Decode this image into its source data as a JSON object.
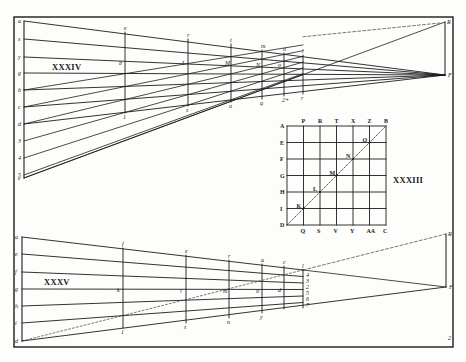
{
  "colors": {
    "ink": "#1c1c1c",
    "paper": "#fdfdfb",
    "faint": "#555555"
  },
  "frame": {
    "x": 14,
    "y": 17,
    "w": 439,
    "h": 330
  },
  "page_mark": {
    "text": "2",
    "x": 448,
    "y": 340
  },
  "figure_xxxiv": {
    "caption": "XXXIV",
    "caption_pos": [
      52,
      70
    ],
    "left_x": 24,
    "left_points": [
      {
        "label": "a",
        "y": 21
      },
      {
        "label": "s",
        "y": 39
      },
      {
        "label": "y",
        "y": 57
      },
      {
        "label": "g",
        "y": 73
      },
      {
        "label": "b",
        "y": 90
      },
      {
        "label": "c",
        "y": 107
      },
      {
        "label": "d",
        "y": 124
      },
      {
        "label": "3",
        "y": 141
      },
      {
        "label": "4",
        "y": 158
      },
      {
        "label": "5",
        "y": 175
      },
      {
        "label": "e",
        "y": 178
      }
    ],
    "vanish_low": {
      "label": "F",
      "x": 445,
      "y": 75
    },
    "vanish_high": {
      "label": "R",
      "x": 445,
      "y": 22
    },
    "verticals": [
      {
        "x": 125,
        "y1": 32,
        "y2": 113,
        "top": "e",
        "mid": "b",
        "bot": "1"
      },
      {
        "x": 188,
        "y1": 39,
        "y2": 106,
        "top": "r",
        "mid": "L",
        "bot": "s"
      },
      {
        "x": 231,
        "y1": 44,
        "y2": 102,
        "top": "t",
        "mid": "M",
        "bot": "u"
      },
      {
        "x": 262,
        "y1": 50,
        "y2": 99,
        "top": "m",
        "mid": "N",
        "bot": "q"
      },
      {
        "x": 284,
        "y1": 53,
        "y2": 96,
        "top": "n",
        "mid": "o",
        "bot": "2+"
      },
      {
        "x": 303,
        "y1": 55,
        "y2": 94,
        "top": "l",
        "mid": "",
        "bot": "r"
      }
    ]
  },
  "figure_xxxiii": {
    "caption": "XXXIII",
    "caption_pos": [
      393,
      183
    ],
    "grid": {
      "x": 287,
      "y": 126,
      "cell": 16.5,
      "n": 6
    },
    "top_labels": [
      "A",
      "P",
      "R",
      "T",
      "X",
      "Z",
      "B"
    ],
    "bottom_labels": [
      "D",
      "Q",
      "S",
      "V",
      "Y",
      "AA",
      "C"
    ],
    "left_labels": [
      "A",
      "E",
      "F",
      "G",
      "H",
      "I",
      "D"
    ],
    "diagonal_points": [
      "K",
      "L",
      "M",
      "N",
      "O"
    ]
  },
  "figure_xxxv": {
    "caption": "XXXV",
    "caption_pos": [
      44,
      285
    ],
    "left_x": 22,
    "left_points": [
      {
        "label": "a",
        "y": 237
      },
      {
        "label": "e",
        "y": 254
      },
      {
        "label": "f",
        "y": 272
      },
      {
        "label": "g",
        "y": 289
      },
      {
        "label": "h",
        "y": 306
      },
      {
        "label": "i",
        "y": 323
      },
      {
        "label": "d",
        "y": 341
      }
    ],
    "vanish_low": {
      "label": "F",
      "x": 446,
      "y": 287
    },
    "vanish_high": {
      "label": "R",
      "x": 446,
      "y": 234
    },
    "focus": {
      "label": "l",
      "x": 303,
      "y": 270
    },
    "verticals": [
      {
        "x": 123,
        "y1": 248,
        "y2": 328,
        "top": "f",
        "mid": "k",
        "bot": "1"
      },
      {
        "x": 186,
        "y1": 255,
        "y2": 323,
        "top": "e",
        "mid": "l",
        "bot": "s"
      },
      {
        "x": 229,
        "y1": 260,
        "y2": 318,
        "top": "r",
        "mid": "m",
        "bot": "n"
      },
      {
        "x": 262,
        "y1": 264,
        "y2": 313,
        "top": "a",
        "mid": "o",
        "bot": "y"
      },
      {
        "x": 284,
        "y1": 266,
        "y2": 309,
        "top": "c",
        "mid": "d",
        "bot": ""
      },
      {
        "x": 303,
        "y1": 270,
        "y2": 308,
        "top": "l",
        "mid": "",
        "bot": ""
      }
    ],
    "stack_labels": [
      "4",
      "3",
      "2",
      "5",
      "6",
      "7"
    ]
  }
}
